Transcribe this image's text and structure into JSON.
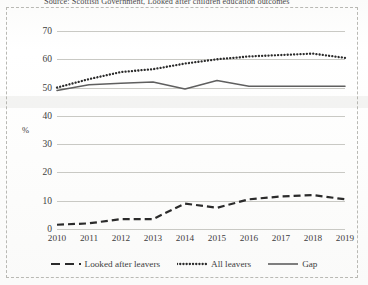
{
  "source_caption": "Source: Scottish Government, Looked after children education outcomes",
  "axis": {
    "unit_label": "%"
  },
  "legend": {
    "position": "bottom-center",
    "items": [
      {
        "label": "Looked after leavers",
        "style": "dashed",
        "color": "#2b2b2b"
      },
      {
        "label": "All leavers",
        "style": "dotted",
        "color": "#2b2b2b"
      },
      {
        "label": "Gap",
        "style": "solid",
        "color": "#5f5f5f"
      }
    ]
  },
  "chart_data": {
    "type": "line",
    "title": "",
    "subtitle": "",
    "xlabel": "",
    "ylabel": "%",
    "categories": [
      "2010",
      "2011",
      "2012",
      "2013",
      "2014",
      "2015",
      "2016",
      "2017",
      "2018",
      "2019"
    ],
    "x": [
      2010,
      2011,
      2012,
      2013,
      2014,
      2015,
      2016,
      2017,
      2018,
      2019
    ],
    "ylim": [
      0,
      70
    ],
    "yticks": [
      0,
      10,
      20,
      30,
      40,
      50,
      60,
      70
    ],
    "grid": true,
    "grid_axis": "y",
    "legend_position": "bottom-center",
    "series": [
      {
        "name": "All leavers",
        "style": "dotted",
        "color": "#2b2b2b",
        "values": [
          50.0,
          53.0,
          55.5,
          56.5,
          58.5,
          60.0,
          61.0,
          61.5,
          62.0,
          60.5
        ]
      },
      {
        "name": "Gap",
        "style": "solid",
        "color": "#5f5f5f",
        "values": [
          49.0,
          51.0,
          51.5,
          52.0,
          49.5,
          52.5,
          50.5,
          50.5,
          50.5,
          50.5
        ]
      },
      {
        "name": "Looked after leavers",
        "style": "dashed",
        "color": "#2b2b2b",
        "values": [
          1.5,
          2.0,
          3.5,
          3.5,
          9.0,
          7.5,
          10.5,
          11.5,
          12.0,
          10.5
        ]
      }
    ]
  }
}
